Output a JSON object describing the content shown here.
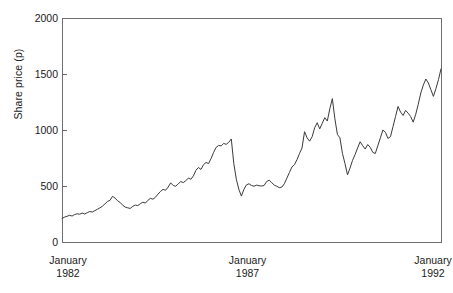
{
  "chart_data": {
    "type": "line",
    "title": "",
    "xlabel": "",
    "ylabel": "Share price (p)",
    "ylim": [
      0,
      2000
    ],
    "yticks": [
      0,
      500,
      1000,
      1500,
      2000
    ],
    "ytick_labels": [
      "0",
      "500",
      "1000",
      "1500",
      "2000"
    ],
    "xtick_labels": [
      {
        "month": "January",
        "year": "1982"
      },
      {
        "month": "January",
        "year": "1987"
      },
      {
        "month": "January",
        "year": "1992"
      }
    ],
    "xlim_labels": [
      "January 1982",
      "January 1992"
    ],
    "grid": false,
    "legend": null,
    "line_color": "#3a3a3a",
    "axis_color": "#6e6e6e",
    "background": "#ffffff",
    "series": [
      {
        "name": "Share price",
        "x_start": "1982-01",
        "x_end": "1992-01",
        "x_step_months": 1,
        "n_points": 121,
        "units": "pence",
        "values": [
          210,
          222,
          230,
          238,
          232,
          245,
          252,
          248,
          258,
          250,
          262,
          272,
          268,
          280,
          292,
          305,
          320,
          340,
          362,
          372,
          408,
          392,
          368,
          352,
          330,
          312,
          305,
          300,
          318,
          330,
          325,
          342,
          355,
          348,
          372,
          390,
          382,
          400,
          428,
          452,
          470,
          462,
          490,
          528,
          505,
          498,
          520,
          540,
          530,
          548,
          570,
          560,
          590,
          640,
          665,
          648,
          690,
          710,
          700,
          745,
          800,
          845,
          862,
          858,
          880,
          872,
          890,
          920,
          700,
          560,
          470,
          410,
          470,
          510,
          520,
          505,
          498,
          508,
          502,
          500,
          505,
          540,
          552,
          530,
          508,
          498,
          485,
          490,
          520,
          570,
          620,
          670,
          690,
          735,
          790,
          840,
          985,
          930,
          900,
          940,
          1020,
          1065,
          1010,
          1060,
          1110,
          1080,
          1190,
          1280,
          1100,
          960,
          930,
          790,
          700,
          600,
          660,
          730,
          780,
          840,
          895,
          860,
          830,
          870,
          845,
          800,
          790,
          860,
          930,
          1000,
          980,
          925,
          940,
          1030,
          1120,
          1210,
          1160,
          1130,
          1175,
          1150,
          1120,
          1070,
          1140,
          1230,
          1330,
          1400,
          1455,
          1420,
          1360,
          1300,
          1370,
          1450,
          1545
        ]
      }
    ]
  }
}
